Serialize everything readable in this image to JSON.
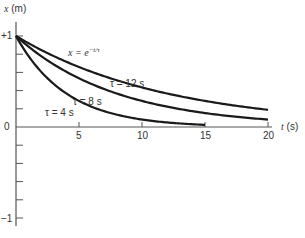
{
  "chart_data": {
    "type": "line",
    "title": "",
    "equation": "x = e^(−t/τ)",
    "xlabel": "t (s)",
    "ylabel": "x (m)",
    "xlim": [
      0,
      20
    ],
    "ylim": [
      -1,
      1
    ],
    "x_ticks": [
      5,
      10,
      15,
      20
    ],
    "x_tick_labels": [
      "5",
      "10",
      "15",
      "20"
    ],
    "y_tick_labels": [
      "+1",
      "0",
      "−1"
    ],
    "y_minor_step": 0.2,
    "grid": false,
    "legend": "inline labels",
    "series": [
      {
        "name": "τ = 12 s",
        "tau": 12,
        "x": [
          0,
          5,
          10,
          15,
          20
        ],
        "values": [
          1.0,
          0.66,
          0.43,
          0.29,
          0.19
        ]
      },
      {
        "name": "τ = 8 s",
        "tau": 8,
        "x": [
          0,
          5,
          10,
          15,
          20
        ],
        "values": [
          1.0,
          0.54,
          0.29,
          0.15,
          0.08
        ]
      },
      {
        "name": "τ = 4 s",
        "tau": 4,
        "x": [
          0,
          5,
          10,
          15
        ],
        "values": [
          1.0,
          0.29,
          0.08,
          0.02
        ]
      }
    ]
  },
  "labels": {
    "ylabel_var": "x",
    "ylabel_unit": "(m)",
    "xlabel_var": "t",
    "xlabel_unit": "(s)",
    "y_plus_one": "+1",
    "y_zero": "0",
    "y_minus_one": "−1",
    "equation_lhs": "x = e",
    "equation_exp": "−t/τ",
    "tau12": "τ = 12 s",
    "tau8": "τ = 8 s",
    "tau4": "τ = 4 s",
    "xt5": "5",
    "xt10": "10",
    "xt15": "15",
    "xt20": "20"
  },
  "colors": {
    "axis": "#555555",
    "curve": "#1a1a1a"
  }
}
